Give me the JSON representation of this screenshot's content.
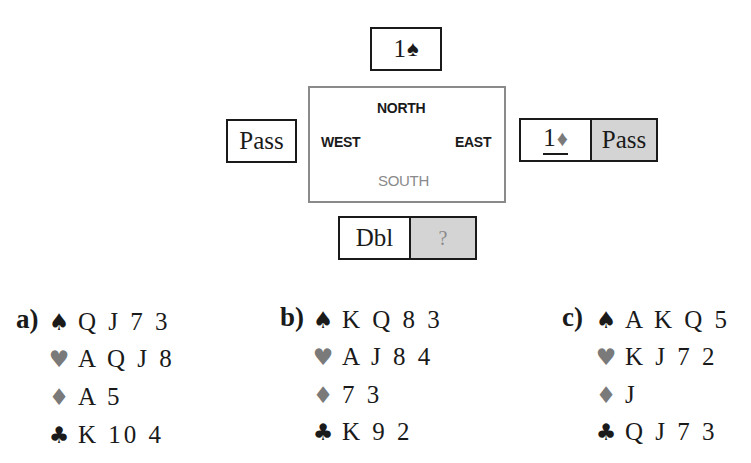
{
  "colors": {
    "ink": "#1a1a1a",
    "red_suit": "#7a7a7a",
    "shade": "#d4d4d4",
    "table_border": "#8a8a8a",
    "south_label": "#8a8a8a"
  },
  "table": {
    "north": "NORTH",
    "west": "WEST",
    "east": "EAST",
    "south": "SOUTH"
  },
  "bids": {
    "north": {
      "level": "1",
      "suit_icon": "♠"
    },
    "west": {
      "call": "Pass"
    },
    "east": [
      {
        "level": "1",
        "suit_icon": "♦",
        "underlined": true
      },
      {
        "call": "Pass",
        "shaded": true
      }
    ],
    "south": [
      {
        "call": "Dbl"
      },
      {
        "call": "?",
        "shaded": true
      }
    ]
  },
  "hands": [
    {
      "label": "a)",
      "spades": "Q J 7 3",
      "hearts": "A Q J 8",
      "diamonds": "A 5",
      "clubs": "K 10 4"
    },
    {
      "label": "b)",
      "spades": "K Q 8 3",
      "hearts": "A J 8 4",
      "diamonds": "7 3",
      "clubs": "K 9 2"
    },
    {
      "label": "c)",
      "spades": "A K Q 5",
      "hearts": "K J 7 2",
      "diamonds": "J",
      "clubs": "Q J 7 3"
    }
  ],
  "suit_icons": {
    "spades": "♠",
    "hearts": "♥",
    "diamonds": "♦",
    "clubs": "♣"
  }
}
